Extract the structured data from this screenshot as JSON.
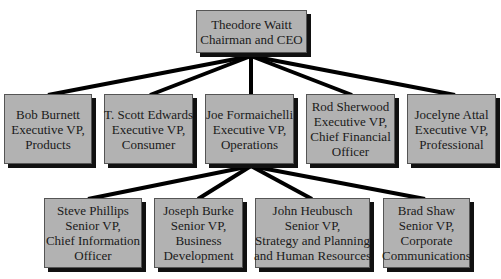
{
  "chart": {
    "ceo": {
      "lines": [
        "Theodore Waitt",
        "Chairman and CEO"
      ]
    },
    "executives": [
      {
        "lines": [
          "Bob Burnett",
          "Executive VP,",
          "Products"
        ]
      },
      {
        "lines": [
          "T. Scott Edwards",
          "Executive VP,",
          "Consumer"
        ]
      },
      {
        "lines": [
          "Joe Formaichelli",
          "Executive VP,",
          "Operations"
        ]
      },
      {
        "lines": [
          "Rod Sherwood",
          "Executive VP,",
          "Chief Financial",
          "Officer"
        ]
      },
      {
        "lines": [
          "Jocelyne Attal",
          "Executive VP,",
          "Professional"
        ]
      }
    ],
    "senior_vps": [
      {
        "lines": [
          "Steve Phillips",
          "Senior VP,",
          "Chief Information",
          "Officer"
        ]
      },
      {
        "lines": [
          "Joseph Burke",
          "Senior VP,",
          "Business",
          "Development"
        ]
      },
      {
        "lines": [
          "John Heubusch",
          "Senior VP,",
          "Strategy and Planning",
          "and Human Resources"
        ]
      },
      {
        "lines": [
          "Brad Shaw",
          "Senior VP,",
          "Corporate",
          "Communications"
        ]
      }
    ],
    "colors": {
      "box": "#b2b2b2",
      "shadow": "#111111",
      "connector": "#000000"
    }
  }
}
